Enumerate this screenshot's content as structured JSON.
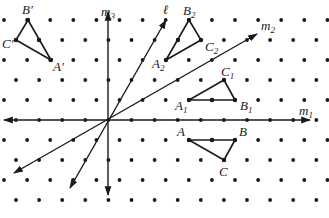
{
  "figure": {
    "colors": {
      "ink": "#1a1a1a",
      "background": "#ffffff"
    },
    "grid": {
      "rows_y": [
        20,
        40,
        60,
        80,
        100,
        120,
        140,
        160,
        180,
        200
      ],
      "even_row_x0": 4,
      "odd_row_x0": 16,
      "dx": 23.1,
      "origin": [
        108,
        120
      ]
    },
    "lines": {
      "m1": {
        "label": "m",
        "sub": "1",
        "from": [
          4,
          120
        ],
        "to": [
          310,
          120
        ],
        "label_pos": [
          299,
          115
        ]
      },
      "m2": {
        "label": "m",
        "sub": "2",
        "from": [
          14,
          173
        ],
        "to": [
          257,
          34
        ],
        "label_pos": [
          261,
          30
        ]
      },
      "m3": {
        "label": "m",
        "sub": "3",
        "from": [
          108,
          195
        ],
        "to": [
          108,
          12
        ],
        "label_pos": [
          101,
          16
        ]
      },
      "l": {
        "label": "ℓ",
        "from": [
          70,
          188
        ],
        "to": [
          166,
          20
        ],
        "label_pos": [
          163,
          14
        ]
      }
    },
    "triangles": [
      {
        "name": "ABC",
        "A": {
          "pt": [
            189,
            140
          ],
          "label": "A",
          "sub": "",
          "label_pos": [
            177,
            136
          ]
        },
        "B": {
          "pt": [
            235,
            140
          ],
          "label": "B",
          "sub": "",
          "label_pos": [
            239,
            136
          ]
        },
        "C": {
          "pt": [
            224,
            160
          ],
          "label": "C",
          "sub": "",
          "label_pos": [
            219,
            176
          ]
        },
        "mid": [
          212,
          140
        ]
      },
      {
        "name": "A1B1C1",
        "A": {
          "pt": [
            189,
            100
          ],
          "label": "A",
          "sub": "1",
          "label_pos": [
            175,
            110
          ]
        },
        "B": {
          "pt": [
            235,
            100
          ],
          "label": "B",
          "sub": "1",
          "label_pos": [
            240,
            110
          ]
        },
        "C": {
          "pt": [
            224,
            80
          ],
          "label": "C",
          "sub": "1",
          "label_pos": [
            221,
            76
          ]
        },
        "mid": [
          212,
          100
        ]
      },
      {
        "name": "A2B2C2",
        "A": {
          "pt": [
            166,
            60
          ],
          "label": "A",
          "sub": "2",
          "label_pos": [
            152,
            68
          ]
        },
        "B": {
          "pt": [
            189,
            20
          ],
          "label": "B",
          "sub": "2",
          "label_pos": [
            183,
            15
          ]
        },
        "C": {
          "pt": [
            201,
            40
          ],
          "label": "C",
          "sub": "2",
          "label_pos": [
            205,
            51
          ]
        },
        "mid": [
          178,
          40
        ]
      },
      {
        "name": "A'B'C'",
        "A": {
          "pt": [
            51,
            60
          ],
          "label": "A′",
          "sub": "",
          "label_pos": [
            53,
            71
          ]
        },
        "B": {
          "pt": [
            28,
            20
          ],
          "label": "B′",
          "sub": "",
          "label_pos": [
            22,
            14
          ]
        },
        "C": {
          "pt": [
            16,
            40
          ],
          "label": "C′",
          "sub": "",
          "label_pos": [
            2,
            48
          ]
        },
        "mid": [
          39,
          40
        ]
      }
    ]
  }
}
